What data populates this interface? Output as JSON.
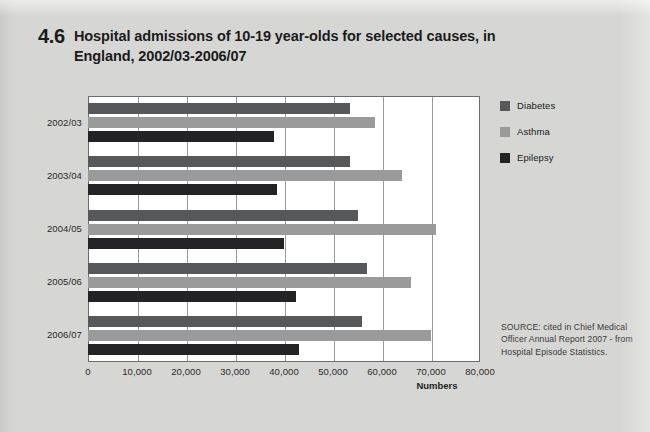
{
  "figure": {
    "number": "4.6",
    "title": "Hospital admissions of 10-19 year-olds for selected causes, in England, 2002/03-2006/07"
  },
  "source_note": "SOURCE: cited in Chief Medical Officer Annual Report 2007 - from Hospital Episode Statistics.",
  "legend": {
    "items": [
      {
        "label": "Diabetes",
        "color": "#57585a"
      },
      {
        "label": "Asthma",
        "color": "#9a9a9a"
      },
      {
        "label": "Epilepsy",
        "color": "#232325"
      }
    ]
  },
  "chart_data": {
    "type": "bar",
    "orientation": "horizontal",
    "title": "Hospital admissions of 10-19 year-olds for selected causes, in England, 2002/03-2006/07",
    "xlabel": "Numbers",
    "ylabel": "",
    "categories": [
      "2002/03",
      "2003/04",
      "2004/05",
      "2005/06",
      "2006/07"
    ],
    "series": [
      {
        "name": "Diabetes",
        "color": "#57585a",
        "values": [
          53500,
          53500,
          55000,
          57000,
          56000
        ]
      },
      {
        "name": "Asthma",
        "color": "#9a9a9a",
        "values": [
          58500,
          64000,
          71000,
          66000,
          70000
        ]
      },
      {
        "name": "Epilepsy",
        "color": "#232325",
        "values": [
          38000,
          38500,
          40000,
          42500,
          43000
        ]
      }
    ],
    "xlim": [
      0,
      80000
    ],
    "xticks": [
      0,
      10000,
      20000,
      30000,
      40000,
      50000,
      60000,
      70000,
      80000
    ],
    "xtick_labels": [
      "0",
      "10,000",
      "20,000",
      "30,000",
      "40,000",
      "50,000",
      "60,000",
      "70,000",
      "80,000"
    ],
    "grid": true,
    "grid_axis": "x",
    "legend_position": "right-top"
  }
}
